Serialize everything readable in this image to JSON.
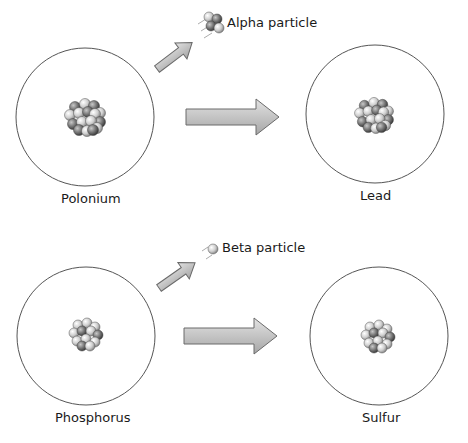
{
  "diagram": {
    "rows": [
      {
        "parent": {
          "label": "Polonium"
        },
        "emitted": {
          "label": "Alpha particle",
          "icon": "alpha-particle-icon"
        },
        "daughter": {
          "label": "Lead"
        }
      },
      {
        "parent": {
          "label": "Phosphorus"
        },
        "emitted": {
          "label": "Beta particle",
          "icon": "beta-particle-icon"
        },
        "daughter": {
          "label": "Sulfur"
        }
      }
    ],
    "colors": {
      "circle_stroke": "#555555",
      "arrow_fill": "#b8b8b8",
      "arrow_stroke": "#6a6a6a",
      "nucleon_dark": "#7a7a7a",
      "nucleon_light": "#d6d6d6"
    }
  }
}
